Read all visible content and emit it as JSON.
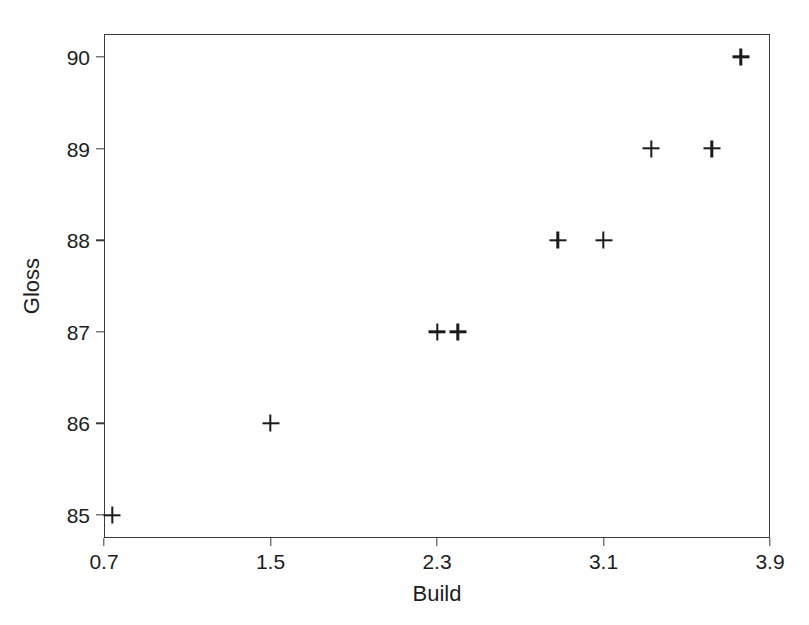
{
  "chart_data": {
    "type": "scatter",
    "title": "",
    "xlabel": "Build",
    "ylabel": "Gloss",
    "xlim": [
      0.7,
      3.9
    ],
    "ylim": [
      84.75,
      90.25
    ],
    "xticks": [
      0.7,
      1.5,
      2.3,
      3.1,
      3.9
    ],
    "xtick_labels": [
      "0.7",
      "1.5",
      "2.3",
      "3.1",
      "3.9"
    ],
    "yticks": [
      85,
      86,
      87,
      88,
      89,
      90
    ],
    "ytick_labels": [
      "85",
      "86",
      "87",
      "88",
      "89",
      "90"
    ],
    "grid": false,
    "legend": false,
    "marker": "plus",
    "marker_color": "#1a1a1a",
    "frame_color": "#3a3a3a",
    "background_color": "#ffffff",
    "points": [
      {
        "x": 0.74,
        "y": 85
      },
      {
        "x": 1.5,
        "y": 86
      },
      {
        "x": 2.3,
        "y": 87
      },
      {
        "x": 2.4,
        "y": 87
      },
      {
        "x": 2.88,
        "y": 88
      },
      {
        "x": 3.1,
        "y": 88
      },
      {
        "x": 3.33,
        "y": 89
      },
      {
        "x": 3.62,
        "y": 89
      },
      {
        "x": 3.76,
        "y": 90
      }
    ],
    "x": [
      0.74,
      1.5,
      2.3,
      2.4,
      2.88,
      3.1,
      3.33,
      3.62,
      3.76
    ],
    "values": [
      85,
      86,
      87,
      87,
      88,
      88,
      89,
      89,
      90
    ]
  }
}
